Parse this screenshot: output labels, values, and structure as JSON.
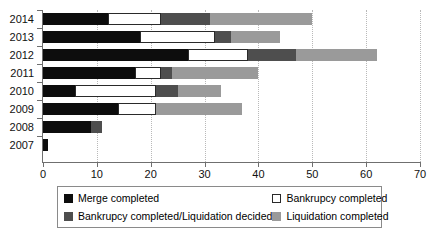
{
  "chart_data": {
    "type": "bar",
    "orientation": "horizontal",
    "stacked": true,
    "title": "",
    "xlabel": "",
    "ylabel": "",
    "xlim": [
      0,
      70
    ],
    "ylim": null,
    "grid": true,
    "grid_axis": "x",
    "legend_position": "bottom",
    "categories": [
      "2014",
      "2013",
      "2012",
      "2011",
      "2010",
      "2009",
      "2008",
      "2007"
    ],
    "x_ticks": [
      0,
      10,
      20,
      30,
      40,
      50,
      60,
      70
    ],
    "x_tick_labels": [
      "0",
      "10",
      "20",
      "30",
      "40",
      "50",
      "60",
      "70"
    ],
    "series": [
      {
        "name": "Merge completed",
        "color": "#0d0d0d",
        "key": "merge",
        "values": [
          12,
          18,
          27,
          17,
          6,
          14,
          9,
          1
        ]
      },
      {
        "name": "Bankrupcy completed",
        "color": "#ffffff",
        "key": "bankruptcy",
        "values": [
          10,
          14,
          11,
          5,
          15,
          7,
          0,
          0
        ]
      },
      {
        "name": "Bankrupcy completed/Liquidation decided",
        "color": "#4e4e4e",
        "key": "bkliq",
        "values": [
          9,
          3,
          9,
          2,
          4,
          0,
          2,
          0
        ]
      },
      {
        "name": "Liquidation completed",
        "color": "#9a9a9a",
        "key": "liq",
        "values": [
          19,
          9,
          15,
          16,
          8,
          16,
          0,
          0
        ]
      }
    ],
    "totals": [
      50,
      44,
      62,
      40,
      33,
      37,
      11,
      1
    ]
  },
  "legend": {
    "items": [
      {
        "label": "Merge completed",
        "key": "merge"
      },
      {
        "label": "Bankrupcy completed",
        "key": "bankruptcy"
      },
      {
        "label": "Bankrupcy completed/Liquidation decided",
        "key": "bkliq"
      },
      {
        "label": "Liquidation completed",
        "key": "liq"
      }
    ]
  }
}
